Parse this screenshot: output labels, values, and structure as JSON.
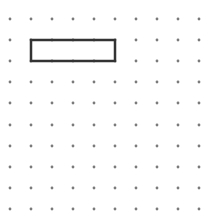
{
  "grid": {
    "x": [
      10,
      31,
      52,
      73,
      94,
      115,
      136,
      157,
      178,
      199
    ],
    "y": [
      19,
      40,
      61,
      82,
      103,
      125,
      146,
      167,
      188,
      209
    ],
    "dot_radius": 1.4,
    "dot_color": "#7a7a7a"
  },
  "shapes": [
    {
      "type": "rectangle",
      "x": 31,
      "y": 40,
      "width": 84,
      "height": 21,
      "stroke": "#333333",
      "stroke_width": 2.5,
      "fill": "none"
    }
  ]
}
